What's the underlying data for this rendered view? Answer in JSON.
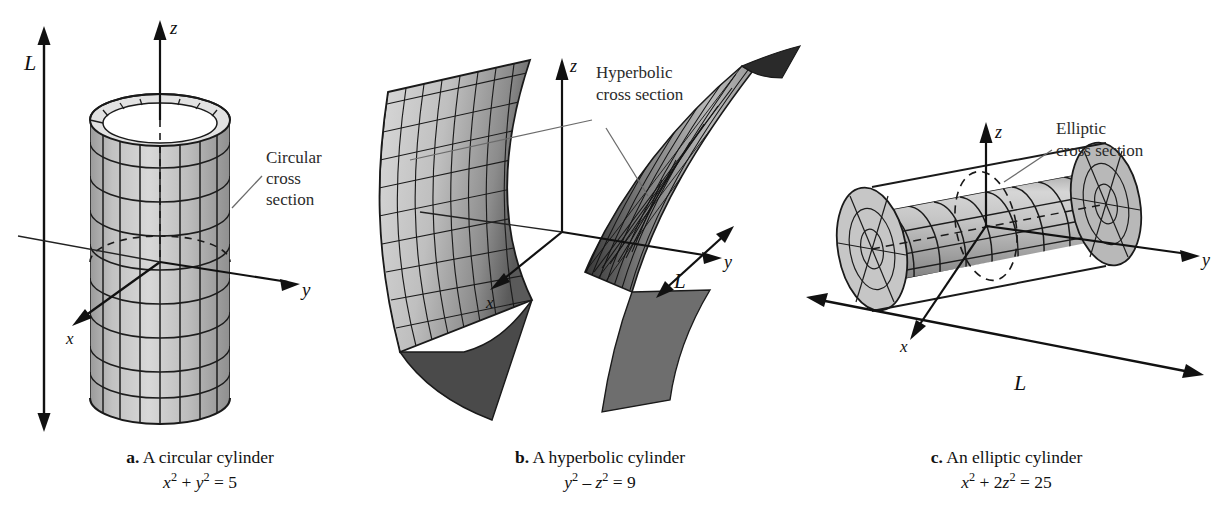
{
  "figure": {
    "background": "#ffffff",
    "mesh_fill": "#c8c8c8",
    "mesh_line": "#1a1a1a",
    "axis_color": "#111111",
    "leader_color": "#6b6b6b"
  },
  "panels": [
    {
      "id": "a",
      "caption_lead": "a.",
      "caption_text": "A circular cylinder",
      "equation": {
        "lhs_terms": [
          "x",
          "y"
        ],
        "display": "x2 + y2 = 5",
        "value": "5"
      },
      "annotation": {
        "lines": [
          "Circular",
          "cross",
          "section"
        ]
      },
      "axes": [
        {
          "name": "z",
          "label": "z"
        },
        {
          "name": "y",
          "label": "y"
        },
        {
          "name": "x",
          "label": "x"
        }
      ],
      "length_label": "L",
      "length_arrow": "double-headed vertical"
    },
    {
      "id": "b",
      "caption_lead": "b.",
      "caption_text": "A hyperbolic cylinder",
      "equation": {
        "lhs_terms": [
          "y",
          "z"
        ],
        "display": "y2 - z2 = 9",
        "value": "9"
      },
      "annotation": {
        "lines": [
          "Hyperbolic",
          "cross section"
        ]
      },
      "axes": [
        {
          "name": "z",
          "label": "z"
        },
        {
          "name": "y",
          "label": "y"
        },
        {
          "name": "x",
          "label": "x"
        }
      ],
      "length_label": "L",
      "length_arrow": "double-headed diagonal"
    },
    {
      "id": "c",
      "caption_lead": "c.",
      "caption_text": "An elliptic cylinder",
      "equation": {
        "lhs_terms": [
          "x",
          "z"
        ],
        "display": "x2 + 2z2 = 25",
        "value": "25"
      },
      "annotation": {
        "lines": [
          "Elliptic",
          "cross section"
        ]
      },
      "axes": [
        {
          "name": "z",
          "label": "z"
        },
        {
          "name": "y",
          "label": "y"
        },
        {
          "name": "x",
          "label": "x"
        }
      ],
      "length_label": "L",
      "length_arrow": "double-headed along axis"
    }
  ],
  "captions": {
    "a": {
      "lead": "a.",
      "text": "A circular cylinder",
      "eq_x": "x",
      "eq_y": "y",
      "eq_rhs": "5",
      "eq_op": "+"
    },
    "b": {
      "lead": "b.",
      "text": "A hyperbolic cylinder",
      "eq_x": "y",
      "eq_y": "z",
      "eq_rhs": "9",
      "eq_op": "–"
    },
    "c": {
      "lead": "c.",
      "text": "An elliptic cylinder",
      "eq_x": "x",
      "eq_y": "z",
      "eq_rhs": "25",
      "eq_op": "+",
      "coef": "2"
    }
  },
  "labels": {
    "z": "z",
    "y": "y",
    "x": "x",
    "L": "L",
    "circular_1": "Circular",
    "circular_2": "cross",
    "circular_3": "section",
    "hyperbolic_1": "Hyperbolic",
    "hyperbolic_2": "cross section",
    "elliptic_1": "Elliptic",
    "elliptic_2": "cross section"
  }
}
